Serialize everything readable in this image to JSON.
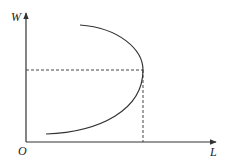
{
  "diagram": {
    "type": "backward-bending-supply-curve",
    "axes": {
      "y_label": "W",
      "x_label": "L",
      "origin_label": "O"
    },
    "curve": {
      "description": "backward-bending curve",
      "color": "#333333"
    },
    "reference_lines": {
      "style": "dashed",
      "horizontal": "from W-axis to curve turning point",
      "vertical": "from turning point down to L-axis"
    },
    "colors": {
      "axis": "#333333",
      "dashed": "#444444",
      "background": "#ffffff"
    }
  }
}
